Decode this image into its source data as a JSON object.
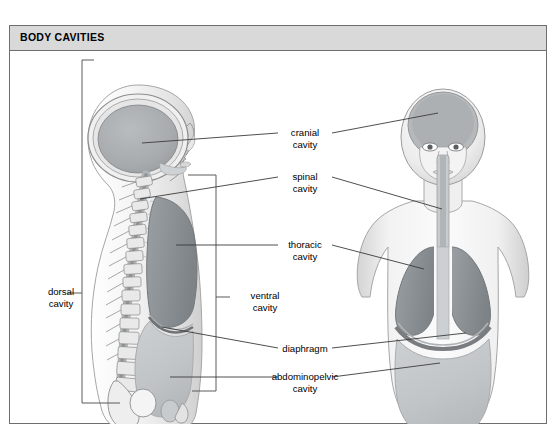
{
  "figure": {
    "title": "BODY CAVITIES",
    "frame_border_color": "#6e6e6e",
    "titlebar_bg": "#d9d9d9",
    "background": "#ffffff"
  },
  "labels": [
    {
      "id": "dorsal",
      "line1": "dorsal",
      "line2": "cavity"
    },
    {
      "id": "ventral",
      "line1": "ventral",
      "line2": "cavity"
    },
    {
      "id": "cranial",
      "line1": "cranial",
      "line2": "cavity"
    },
    {
      "id": "spinal",
      "line1": "spinal",
      "line2": "cavity"
    },
    {
      "id": "thoracic",
      "line1": "thoracic",
      "line2": "cavity"
    },
    {
      "id": "diaphragm",
      "line1": "diaphragm",
      "line2": ""
    },
    {
      "id": "abdominopelvic",
      "line1": "abdominopelvic",
      "line2": "cavity"
    }
  ],
  "figures": {
    "lateral_view": "lateral sagittal body view",
    "anterior_view": "anterior frontal body view"
  },
  "colors": {
    "cavity_dark": "#8e9296",
    "cavity_light": "#c3c6c8",
    "body_fill": "#f2f2f2",
    "body_outline": "#9a9a9a",
    "leader_line": "#3b3b3b",
    "bracket": "#5a5a5a",
    "skin_shade": "#dcdcdc"
  }
}
